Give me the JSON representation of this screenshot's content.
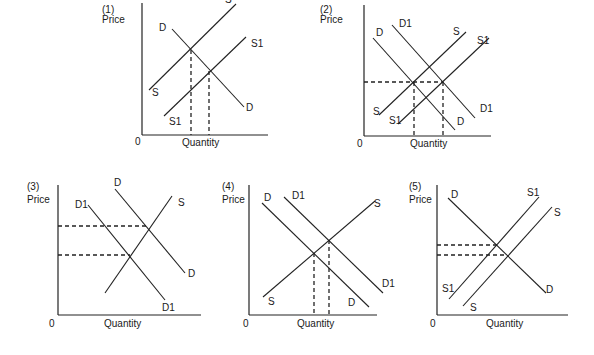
{
  "graphs": [
    {
      "id": "1",
      "number_label": "(1)",
      "y_label": "Price",
      "x_label": "Quantity",
      "origin_label": "0",
      "axes": {
        "x0": 142,
        "y0": 135,
        "x1": 268,
        "ytop": 3
      },
      "lines": [
        {
          "name": "S",
          "x1": 149,
          "y1": 90,
          "x2": 236,
          "y2": 4,
          "labels": [
            {
              "text": "S",
              "x": 152,
              "y": 96
            },
            {
              "text": "S",
              "x": 225,
              "y": 3
            }
          ]
        },
        {
          "name": "D",
          "x1": 172,
          "y1": 29,
          "x2": 244,
          "y2": 107,
          "labels": [
            {
              "text": "D",
              "x": 159,
              "y": 31
            },
            {
              "text": "D",
              "x": 246,
              "y": 111
            }
          ]
        },
        {
          "name": "S1",
          "x1": 164,
          "y1": 116,
          "x2": 246,
          "y2": 37,
          "labels": [
            {
              "text": "S1",
              "x": 169,
              "y": 125
            },
            {
              "text": "S1",
              "x": 251,
              "y": 47
            }
          ]
        }
      ],
      "dashed": [
        {
          "x1": 191,
          "y1": 50,
          "x2": 191,
          "y2": 135
        },
        {
          "x1": 209,
          "y1": 71,
          "x2": 209,
          "y2": 135
        }
      ],
      "text_pos": {
        "num": [
          102,
          13
        ],
        "price": [
          102,
          23
        ],
        "zero": [
          135,
          145
        ],
        "qty": [
          182,
          146
        ]
      }
    },
    {
      "id": "2",
      "number_label": "(2)",
      "y_label": "Price",
      "x_label": "Quantity",
      "origin_label": "0",
      "axes": {
        "x0": 364,
        "y0": 136,
        "x1": 491,
        "ytop": 5
      },
      "lines": [
        {
          "name": "D",
          "x1": 373,
          "y1": 38,
          "x2": 455,
          "y2": 130,
          "labels": [
            {
              "text": "D",
              "x": 376,
              "y": 36
            },
            {
              "text": "D",
              "x": 457,
              "y": 125
            }
          ]
        },
        {
          "name": "D1",
          "x1": 392,
          "y1": 25,
          "x2": 475,
          "y2": 118,
          "labels": [
            {
              "text": "D1",
              "x": 399,
              "y": 27
            },
            {
              "text": "D1",
              "x": 480,
              "y": 112
            }
          ]
        },
        {
          "name": "S",
          "x1": 379,
          "y1": 115,
          "x2": 466,
          "y2": 32,
          "labels": [
            {
              "text": "S",
              "x": 373,
              "y": 115
            },
            {
              "text": "S",
              "x": 453,
              "y": 35
            }
          ]
        },
        {
          "name": "S1",
          "x1": 398,
          "y1": 124,
          "x2": 489,
          "y2": 38,
          "labels": [
            {
              "text": "S1",
              "x": 389,
              "y": 124
            },
            {
              "text": "S1",
              "x": 477,
              "y": 44
            }
          ]
        }
      ],
      "dashed": [
        {
          "x1": 364,
          "y1": 82,
          "x2": 443,
          "y2": 82
        },
        {
          "x1": 414,
          "y1": 82,
          "x2": 414,
          "y2": 136
        },
        {
          "x1": 443,
          "y1": 82,
          "x2": 443,
          "y2": 136
        }
      ],
      "text_pos": {
        "num": [
          320,
          13
        ],
        "price": [
          320,
          23
        ],
        "zero": [
          357,
          147
        ],
        "qty": [
          410,
          147
        ]
      }
    },
    {
      "id": "3",
      "number_label": "(3)",
      "y_label": "Price",
      "x_label": "Quantity",
      "origin_label": "0",
      "axes": {
        "x0": 58,
        "y0": 315,
        "x1": 201,
        "ytop": 185
      },
      "lines": [
        {
          "name": "D",
          "x1": 115,
          "y1": 189,
          "x2": 185,
          "y2": 273,
          "labels": [
            {
              "text": "D",
              "x": 114,
              "y": 186
            },
            {
              "text": "D",
              "x": 188,
              "y": 277
            }
          ]
        },
        {
          "name": "D1",
          "x1": 88,
          "y1": 205,
          "x2": 165,
          "y2": 300,
          "labels": [
            {
              "text": "D1",
              "x": 75,
              "y": 208
            },
            {
              "text": "D1",
              "x": 162,
              "y": 311
            }
          ]
        },
        {
          "name": "S",
          "x1": 105,
          "y1": 293,
          "x2": 172,
          "y2": 196,
          "labels": [
            {
              "text": "S",
              "x": 178,
              "y": 206
            }
          ]
        }
      ],
      "dashed": [
        {
          "x1": 58,
          "y1": 226,
          "x2": 149,
          "y2": 226
        },
        {
          "x1": 58,
          "y1": 255,
          "x2": 130,
          "y2": 255
        }
      ],
      "text_pos": {
        "num": [
          27,
          190
        ],
        "price": [
          27,
          203
        ],
        "zero": [
          49,
          327
        ],
        "qty": [
          104,
          327
        ]
      }
    },
    {
      "id": "4",
      "number_label": "(4)",
      "y_label": "Price",
      "x_label": "Quantity",
      "origin_label": "0",
      "axes": {
        "x0": 249,
        "y0": 315,
        "x1": 377,
        "ytop": 185
      },
      "lines": [
        {
          "name": "D",
          "x1": 262,
          "y1": 203,
          "x2": 369,
          "y2": 307,
          "labels": [
            {
              "text": "D",
              "x": 264,
              "y": 201
            },
            {
              "text": "D",
              "x": 348,
              "y": 306
            }
          ]
        },
        {
          "name": "D1",
          "x1": 284,
          "y1": 197,
          "x2": 383,
          "y2": 293,
          "labels": [
            {
              "text": "D1",
              "x": 292,
              "y": 199
            },
            {
              "text": "D1",
              "x": 382,
              "y": 287
            }
          ]
        },
        {
          "name": "S",
          "x1": 263,
          "y1": 297,
          "x2": 375,
          "y2": 201,
          "labels": [
            {
              "text": "S",
              "x": 268,
              "y": 305
            },
            {
              "text": "S",
              "x": 374,
              "y": 207
            }
          ]
        }
      ],
      "dashed": [
        {
          "x1": 314,
          "y1": 253,
          "x2": 314,
          "y2": 315
        },
        {
          "x1": 329,
          "y1": 240,
          "x2": 329,
          "y2": 315
        }
      ],
      "text_pos": {
        "num": [
          222,
          190
        ],
        "price": [
          222,
          203
        ],
        "zero": [
          243,
          327
        ],
        "qty": [
          297,
          327
        ]
      }
    },
    {
      "id": "5",
      "number_label": "(5)",
      "y_label": "Price",
      "x_label": "Quantity",
      "origin_label": "0",
      "axes": {
        "x0": 437,
        "y0": 315,
        "x1": 568,
        "ytop": 185
      },
      "lines": [
        {
          "name": "D",
          "x1": 448,
          "y1": 198,
          "x2": 546,
          "y2": 293,
          "labels": [
            {
              "text": "D",
              "x": 451,
              "y": 198
            },
            {
              "text": "D",
              "x": 546,
              "y": 293
            }
          ]
        },
        {
          "name": "S1",
          "x1": 449,
          "y1": 299,
          "x2": 539,
          "y2": 197,
          "labels": [
            {
              "text": "S1",
              "x": 442,
              "y": 292
            },
            {
              "text": "S1",
              "x": 527,
              "y": 196
            }
          ]
        },
        {
          "name": "S",
          "x1": 463,
          "y1": 306,
          "x2": 552,
          "y2": 207,
          "labels": [
            {
              "text": "S",
              "x": 470,
              "y": 311
            },
            {
              "text": "S",
              "x": 554,
              "y": 216
            }
          ]
        }
      ],
      "dashed": [
        {
          "x1": 437,
          "y1": 245,
          "x2": 497,
          "y2": 245
        },
        {
          "x1": 437,
          "y1": 255,
          "x2": 507,
          "y2": 255
        }
      ],
      "text_pos": {
        "num": [
          409,
          190
        ],
        "price": [
          409,
          203
        ],
        "zero": [
          430,
          327
        ],
        "qty": [
          486,
          327
        ]
      }
    }
  ]
}
